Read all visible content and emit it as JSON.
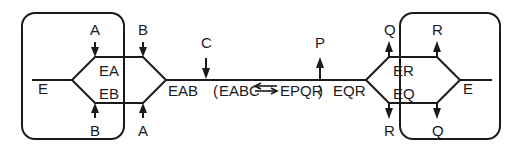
{
  "diagram": {
    "background_color": "#ffffff",
    "line_color": "#1a1a1a",
    "left_enzyme_label": "E",
    "right_enzyme_label": "E",
    "left_complex_upper": "EA",
    "left_complex_lower": "EB",
    "right_complex_upper": "ER",
    "right_complex_lower": "EQ",
    "left_binary_label": "EAB",
    "right_binary_label": "EQR",
    "central_complex_open": "(",
    "central_complex_left": "EABC",
    "central_complex_arrow": "⇌",
    "central_complex_right": "EPQR",
    "central_complex_close": ")",
    "central_complex_full": "(EABC ⇌ EPQR)",
    "substrate_c_label": "C",
    "product_p_label": "P",
    "left_top_inner_label": "A",
    "left_top_outer_label": "B",
    "left_bottom_inner_label": "B",
    "left_bottom_outer_label": "A",
    "right_top_inner_label": "Q",
    "right_top_outer_label": "R",
    "right_bottom_inner_label": "R",
    "right_bottom_outer_label": "Q"
  }
}
